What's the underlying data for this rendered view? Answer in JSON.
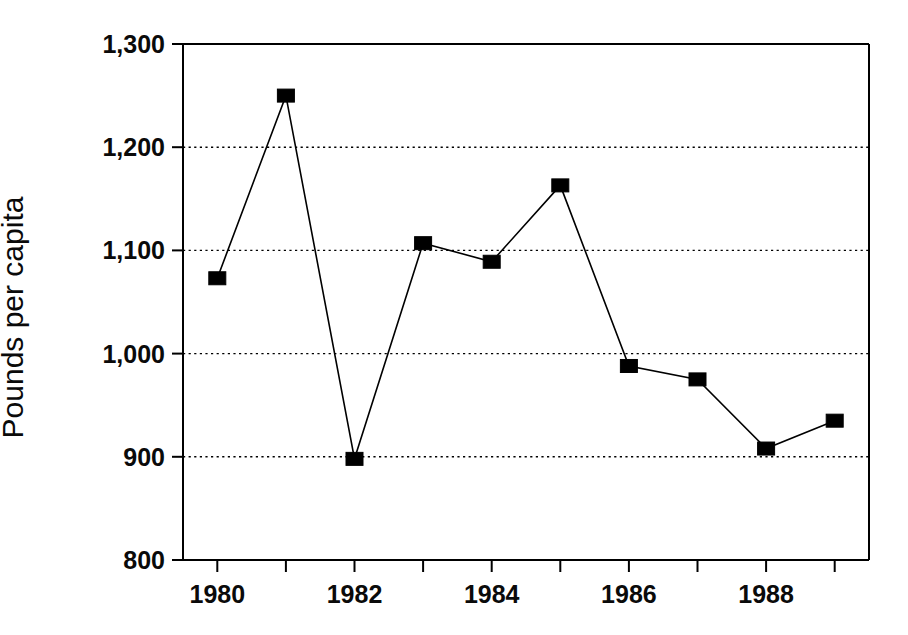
{
  "chart_data": {
    "type": "line",
    "title": "",
    "subtitle": "",
    "xlabel": "",
    "ylabel": "Pounds per capita",
    "x": [
      1980,
      1981,
      1982,
      1983,
      1984,
      1985,
      1986,
      1987,
      1988,
      1989
    ],
    "categories": [
      "1980",
      "1981",
      "1982",
      "1983",
      "1984",
      "1985",
      "1986",
      "1987",
      "1988",
      "1989"
    ],
    "values": [
      1073,
      1250,
      898,
      1107,
      1089,
      1163,
      988,
      975,
      908,
      935
    ],
    "series": [
      {
        "name": "Pounds per capita",
        "values": [
          1073,
          1250,
          898,
          1107,
          1089,
          1163,
          988,
          975,
          908,
          935
        ],
        "marker": "filled-square",
        "marker_color": "#000000",
        "line_color": "#000000"
      }
    ],
    "xlim": [
      1979.5,
      1989.5
    ],
    "ylim": [
      800,
      1300
    ],
    "y_ticks": [
      800,
      900,
      1000,
      1100,
      1200,
      1300
    ],
    "y_tick_labels": [
      "800",
      "900",
      "1,000",
      "1,100",
      "1,200",
      "1,300"
    ],
    "x_ticks": [
      1980,
      1981,
      1982,
      1983,
      1984,
      1985,
      1986,
      1987,
      1988,
      1989
    ],
    "x_tick_labels": [
      "1980",
      "",
      "1982",
      "",
      "1984",
      "",
      "1986",
      "",
      "1988",
      ""
    ],
    "x_major_labels": [
      "1980",
      "1982",
      "1984",
      "1986",
      "1988"
    ],
    "grid": {
      "horizontal": true,
      "vertical": false,
      "style": "dotted",
      "values": [
        900,
        1000,
        1100,
        1200
      ],
      "color": "#000000"
    },
    "legend": {
      "visible": false,
      "position": "none",
      "entries": []
    },
    "annotations": [],
    "axis_color": "#000000",
    "background_color": "#ffffff"
  },
  "axis": {
    "y_labels": [
      {
        "value": 1300,
        "text": "1,300"
      },
      {
        "value": 1200,
        "text": "1,200"
      },
      {
        "value": 1100,
        "text": "1,100"
      },
      {
        "value": 1000,
        "text": "1,000"
      },
      {
        "value": 900,
        "text": "900"
      },
      {
        "value": 800,
        "text": "800"
      }
    ],
    "x_labels": [
      {
        "value": 1980,
        "text": "1980"
      },
      {
        "value": 1982,
        "text": "1982"
      },
      {
        "value": 1984,
        "text": "1984"
      },
      {
        "value": 1986,
        "text": "1986"
      },
      {
        "value": 1988,
        "text": "1988"
      }
    ]
  }
}
